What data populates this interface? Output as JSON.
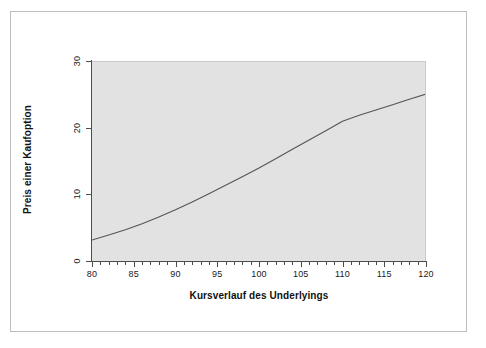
{
  "chart_data": {
    "type": "line",
    "title": "",
    "xlabel": "Kursverlauf des Underlyings",
    "ylabel": "Preis einer Kaufoption",
    "xlim": [
      80,
      120
    ],
    "ylim": [
      0,
      30
    ],
    "xticks": [
      80,
      85,
      90,
      95,
      100,
      105,
      110,
      115,
      120
    ],
    "yticks": [
      0,
      10,
      20,
      30
    ],
    "xtick_labels": [
      "80",
      "85",
      "90",
      "95",
      "100",
      "105",
      "110",
      "115",
      "120"
    ],
    "ytick_labels": [
      "0",
      "10",
      "20",
      "30"
    ],
    "x_minor_tick_step": 1,
    "grid": false,
    "legend": null,
    "plot_background": "#e2e2e2",
    "figure_background": "#ffffff",
    "line_color": "#555555",
    "line_width": 1.1,
    "series": [
      {
        "name": "Kaufoptionspreis",
        "x": [
          80,
          81,
          82,
          83,
          84,
          85,
          86,
          87,
          88,
          89,
          90,
          91,
          92,
          93,
          94,
          95,
          96,
          97,
          98,
          99,
          100,
          101,
          102,
          103,
          104,
          105,
          106,
          107,
          108,
          109,
          110,
          111,
          112,
          113,
          114,
          115,
          116,
          117,
          118,
          119,
          120
        ],
        "y": [
          3.3,
          3.75,
          4.2,
          4.7,
          5.2,
          5.75,
          6.3,
          6.9,
          7.5,
          8.15,
          8.8,
          9.5,
          10.2,
          10.9,
          11.65,
          12.4,
          13.2,
          14.0,
          14.8,
          15.6,
          16.45,
          17.3,
          18.15,
          19.0,
          19.9,
          20.8,
          21.7,
          22.6,
          23.5,
          24.45,
          25.4,
          26.35,
          27.3,
          28.25,
          29.2,
          30.2,
          31.2,
          32.2,
          33.2,
          34.2,
          35.2
        ]
      }
    ],
    "visible_data_range_note": "Curve is clipped by panel; visible from (80, 3.3) rising to (120, 25.2)",
    "visible_series": [
      {
        "name": "Kaufoptionspreis (sichtbar)",
        "x": [
          80,
          82,
          84,
          86,
          88,
          90,
          92,
          94,
          96,
          98,
          100,
          102,
          104,
          106,
          108,
          110,
          112,
          114,
          116,
          118,
          120
        ],
        "y": [
          3.3,
          4.05,
          4.85,
          5.75,
          6.75,
          7.85,
          9.0,
          10.25,
          11.5,
          12.8,
          14.1,
          15.5,
          16.9,
          18.3,
          19.7,
          21.1,
          22.0,
          22.8,
          23.6,
          24.4,
          25.2
        ]
      }
    ]
  },
  "figure": {
    "x_axis_title": "Kursverlauf des Underlyings",
    "y_axis_title": "Preis einer Kaufoption"
  }
}
